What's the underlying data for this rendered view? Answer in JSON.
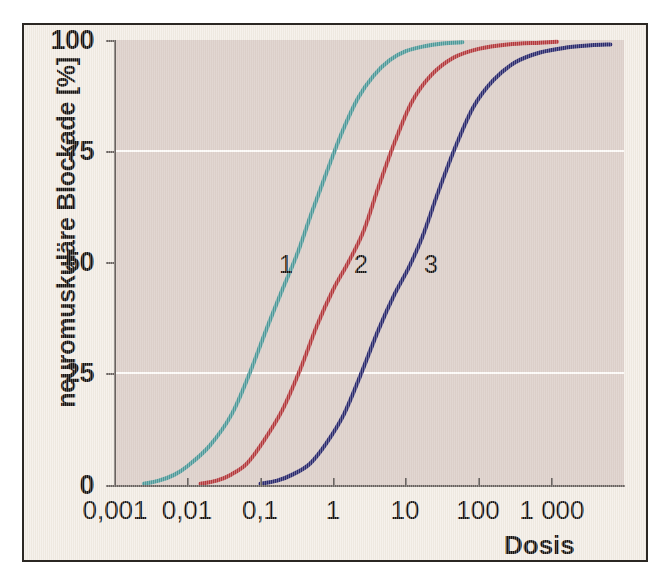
{
  "chart_data": {
    "type": "line",
    "title": "",
    "xlabel": "Dosis",
    "ylabel": "neuromuskuläre Blockade [%]",
    "xscale": "log",
    "xlim": [
      0.001,
      10000
    ],
    "ylim": [
      0,
      100
    ],
    "xticks": [
      0.001,
      0.01,
      0.1,
      1,
      10,
      100,
      1000
    ],
    "xticklabels": [
      "0,001",
      "0,01",
      "0,1",
      "1",
      "10",
      "100",
      "1 000"
    ],
    "yticks": [
      0,
      25,
      50,
      75,
      100
    ],
    "yticklabels": [
      "0",
      "25",
      "50",
      "75",
      "100"
    ],
    "gridlines_y": [
      25,
      75
    ],
    "grid": "horizontal-white-at-25-and-75",
    "legend": "inline-numeric-labels",
    "plot_bg": "#d9c9c2",
    "figure_bg": "#f2ece4",
    "series": [
      {
        "name": "1",
        "label": "1",
        "color": "#4e9a9a",
        "ed50": 0.4,
        "x": [
          0.0025,
          0.004,
          0.0065,
          0.01,
          0.02,
          0.04,
          0.07,
          0.12,
          0.2,
          0.32,
          0.5,
          0.8,
          1.3,
          2.2,
          3.6,
          6,
          10,
          18,
          32,
          60
        ],
        "y": [
          0.5,
          1.2,
          2.5,
          4.5,
          9,
          16,
          25,
          35,
          44,
          52,
          61,
          70,
          79,
          87,
          92,
          95.5,
          97.5,
          98.6,
          99.2,
          99.5
        ]
      },
      {
        "name": "2",
        "label": "2",
        "color": "#b5393c",
        "ed50": 2.2,
        "x": [
          0.015,
          0.025,
          0.04,
          0.065,
          0.11,
          0.2,
          0.35,
          0.6,
          1.0,
          1.6,
          2.6,
          4.2,
          7,
          12,
          22,
          45,
          100,
          250,
          700,
          1200
        ],
        "y": [
          0.5,
          1.2,
          2.6,
          5,
          10,
          17,
          26,
          36,
          44,
          50,
          57,
          67,
          77,
          86,
          92,
          96,
          98,
          99,
          99.4,
          99.6
        ]
      },
      {
        "name": "3",
        "label": "3",
        "color": "#2b2a6e",
        "ed50": 13,
        "x": [
          0.1,
          0.17,
          0.28,
          0.48,
          0.8,
          1.4,
          2.4,
          4.2,
          7,
          11,
          17,
          28,
          48,
          85,
          160,
          320,
          700,
          1600,
          3500,
          6500
        ],
        "y": [
          0.5,
          1.2,
          2.6,
          5,
          9.5,
          16,
          25,
          35,
          43,
          49,
          56,
          66,
          76,
          85,
          91,
          95,
          97.2,
          98.3,
          98.8,
          99.0
        ]
      }
    ],
    "annotations": [
      {
        "text": "1",
        "x_px": 277,
        "y_px": 248
      },
      {
        "text": "2",
        "x_px": 352,
        "y_px": 248
      },
      {
        "text": "3",
        "x_px": 422,
        "y_px": 248
      }
    ]
  }
}
